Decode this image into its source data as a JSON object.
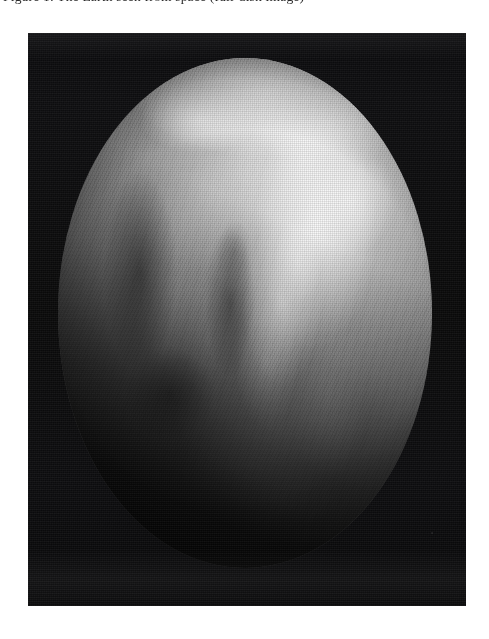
{
  "page": {
    "background_color": "#ffffff",
    "width": 489,
    "height": 639
  },
  "caption": {
    "text": "Figure 1: The Earth seen from space (full-disk image)",
    "clipped": "true"
  },
  "figure": {
    "name": "earth-full-disk-photograph",
    "kind": "grayscale satellite photograph",
    "frame": {
      "x": 28,
      "y": 33,
      "width": 438,
      "height": 573,
      "background_color": "#070708"
    },
    "globe": {
      "label": "Earth",
      "x": 30,
      "y": 25,
      "width": 374,
      "height": 510,
      "illumination": "lit from upper right, terminator across lower left",
      "features": [
        "bright northern cloud cap",
        "bright equatorial cloud band",
        "African landmass on the western limb",
        "dark Atlantic ocean region",
        "southern hemisphere storm swirl",
        "limb darkening toward the edge"
      ],
      "colors": {
        "highlight": "#f4f4f4",
        "midtone": "#7a7a7a",
        "shadow": "#101010",
        "space": "#0a0a0c"
      }
    },
    "starfield": {
      "visible": "true",
      "description": "faint scattered stars in surrounding space"
    }
  }
}
